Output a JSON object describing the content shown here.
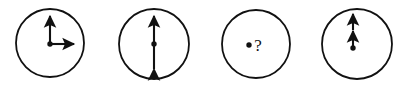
{
  "figure": {
    "type": "vector-diagram",
    "background_color": "#ffffff",
    "stroke_color": "#111111",
    "width": 407,
    "height": 90,
    "panels": [
      {
        "index": 1,
        "name": "panel-up-right-arrows",
        "circle": {
          "cx": 50,
          "cy": 43,
          "r": 34,
          "stroke_width": 1.8
        },
        "center_dot": {
          "cx": 50,
          "cy": 44,
          "r": 2.6
        },
        "arrows": [
          {
            "name": "up-arrow",
            "direction": "up",
            "from": [
              50,
              44
            ],
            "to": [
              50,
              13
            ],
            "double_headed": false
          },
          {
            "name": "right-arrow",
            "direction": "right",
            "from": [
              50,
              44
            ],
            "to": [
              77,
              44
            ],
            "double_headed": false
          }
        ],
        "label": ""
      },
      {
        "index": 2,
        "name": "panel-double-headed-vertical-arrow",
        "circle": {
          "cx": 154,
          "cy": 44,
          "r": 35,
          "stroke_width": 1.8
        },
        "center_dot": {
          "cx": 154,
          "cy": 44,
          "r": 2.6
        },
        "arrows": [
          {
            "name": "vertical-double-arrow",
            "direction": "vertical",
            "from": [
              154,
              73
            ],
            "to": [
              154,
              13
            ],
            "double_headed": true
          }
        ],
        "label": ""
      },
      {
        "index": 3,
        "name": "panel-question-mark",
        "circle": {
          "cx": 256,
          "cy": 44,
          "r": 34,
          "stroke_width": 1.8
        },
        "center_dot": {
          "cx": 249,
          "cy": 45,
          "r": 2.6
        },
        "arrows": [],
        "label": "?"
      },
      {
        "index": 4,
        "name": "panel-stacked-up-arrows",
        "circle": {
          "cx": 357,
          "cy": 44,
          "r": 35,
          "stroke_width": 1.8
        },
        "center_dot": {
          "cx": 353,
          "cy": 48,
          "r": 2.6
        },
        "arrows": [
          {
            "name": "up-arrow-lower",
            "direction": "up",
            "from": [
              353,
              48
            ],
            "to": [
              353,
              28
            ],
            "double_headed": false
          },
          {
            "name": "up-arrow-upper",
            "direction": "up",
            "from": [
              353,
              30
            ],
            "to": [
              353,
              11
            ],
            "double_headed": false
          }
        ],
        "label": ""
      }
    ]
  }
}
